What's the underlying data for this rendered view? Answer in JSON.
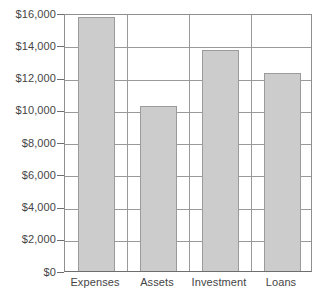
{
  "chart_data": {
    "type": "bar",
    "title": "",
    "subtitle": "",
    "xlabel": "",
    "ylabel": "",
    "categories": [
      "Expenses",
      "Assets",
      "Investment",
      "Loans"
    ],
    "values": [
      15750,
      10250,
      13700,
      12300
    ],
    "series": [
      {
        "name": "",
        "values": [
          15750,
          10250,
          13700,
          12300
        ]
      }
    ],
    "ylim": [
      0,
      16000
    ],
    "ytick_values": [
      0,
      2000,
      4000,
      6000,
      8000,
      10000,
      12000,
      14000,
      16000
    ],
    "ytick_labels": [
      "$0",
      "$2,000",
      "$4,000",
      "$6,000",
      "$8,000",
      "$10,000",
      "$12,000",
      "$14,000",
      "$16,000"
    ],
    "grid": true,
    "grid_axis": "both",
    "legend": false,
    "legend_position": "none",
    "annotations": [],
    "colors": {
      "bar_fill": "#cccccc",
      "bar_border": "#9b9b9b",
      "gridline": "#9a9a9a",
      "axis": "#6e6e6e",
      "text": "#454545",
      "background": "#ffffff"
    }
  }
}
